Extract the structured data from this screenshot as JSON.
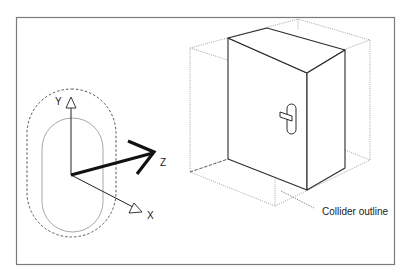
{
  "diagram": {
    "type": "technical-illustration",
    "left_figure": {
      "description": "Capsule collider with coordinate axes",
      "axes": [
        {
          "name": "Y",
          "label": "Y"
        },
        {
          "name": "Z",
          "label": "Z"
        },
        {
          "name": "X",
          "label": "X"
        }
      ]
    },
    "right_figure": {
      "description": "Door with box collider",
      "callout_label": "Collider outline"
    },
    "colors": {
      "frame": "#7a7a7a",
      "solid_lines": "#2a2a2a",
      "capsule_inner": "#a8a8a8",
      "dotted_lines": "#9a9a9a",
      "z_axis": "#111111"
    }
  }
}
